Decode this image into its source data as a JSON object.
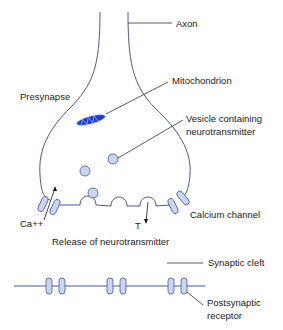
{
  "labels": {
    "axon": "Axon",
    "presynapse": "Presynapse",
    "mitochondrion": "Mitochondrion",
    "vesicle_line1": "Vesicle containing",
    "vesicle_line2": "neurotransmitter",
    "ca": "Ca++",
    "t": "T",
    "calcium_channel": "Calcium channel",
    "release": "Release of neurotransmitter",
    "synaptic_cleft": "Synaptic cleft",
    "postsynaptic_line1": "Postsynaptic",
    "postsynaptic_line2": "receptor"
  },
  "colors": {
    "membrane": "#4a5a8c",
    "vesicle_fill": "#c9d6f2",
    "mitochondrion": "#1f3fc0",
    "leader": "#333333"
  }
}
